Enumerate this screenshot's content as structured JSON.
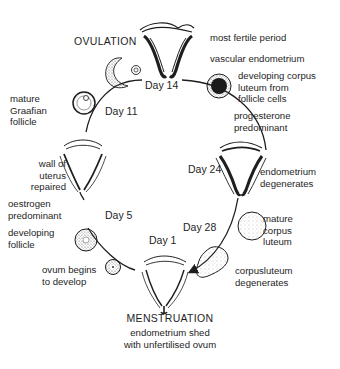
{
  "diagram": {
    "phases": {
      "ovulation": "OVULATION",
      "menstruation": "MENSTRUATION"
    },
    "days": {
      "day1": "Day 1",
      "day5": "Day 5",
      "day11": "Day 11",
      "day14": "Day 14",
      "day24": "Day 24",
      "day28": "Day 28"
    },
    "labels": {
      "most_fertile": "most fertile period",
      "vascular_endometrium": "vascular endometrium",
      "developing_corpus_luteum": "developing corpus\nluteum from\nfollicle cells",
      "progesterone": "progesterone\npredominant",
      "endometrium_degenerates": "endometrium\ndegenerates",
      "mature_corpus_luteum": "mature\ncorpus\nluteum",
      "corpus_luteum_degenerates": "corpusluteum\ndegenerates",
      "menstruation_note": "endometrium shed\nwith unfertilised ovum",
      "ovum_begins": "ovum begins\nto develop",
      "developing_follicle": "developing\nfollicle",
      "oestrogen": "oestrogen\npredominant",
      "wall_repaired": "wall of\nuterus\nrepaired",
      "mature_graafian": "mature\nGraafian\nfollicle"
    },
    "icons": [
      "uterus-ovulation-icon",
      "uterus-day24-icon",
      "uterus-menstruation-icon",
      "uterus-repaired-icon",
      "ruptured-follicle-icon",
      "released-ovum-icon",
      "graafian-follicle-icon",
      "developing-corpus-luteum-icon",
      "mature-corpus-luteum-icon",
      "degenerating-corpus-luteum-icon",
      "early-ovum-icon",
      "developing-follicle-icon",
      "cycle-arrow-icon"
    ],
    "colors": {
      "ink": "#1e1e1e",
      "background": "#ffffff",
      "stipple": "#6a6a6a"
    }
  }
}
